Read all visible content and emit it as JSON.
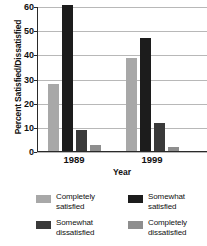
{
  "chart_data": {
    "type": "bar",
    "title": "",
    "xlabel": "Year",
    "ylabel": "Percent Satisfied/Dissatisfied",
    "categories": [
      "1989",
      "1999"
    ],
    "ylim": [
      0,
      60
    ],
    "yticks": [
      0,
      10,
      20,
      30,
      40,
      50,
      60
    ],
    "grid": true,
    "legend_position": "bottom",
    "series": [
      {
        "name": "Completely satisfied",
        "color": "#a8a8a8",
        "values": [
          28,
          39
        ]
      },
      {
        "name": "Somewhat satisfied",
        "color": "#1c1c1c",
        "values": [
          61,
          47
        ]
      },
      {
        "name": "Somewhat dissatisfied",
        "color": "#3a3a3a",
        "values": [
          9,
          12
        ]
      },
      {
        "name": "Completely dissatisfied",
        "color": "#8e8e8e",
        "values": [
          3,
          2
        ]
      }
    ]
  },
  "axes": {
    "ylabel": "Percent Satisfied/Dissatisfied",
    "xlabel": "Year",
    "ytick_labels": [
      "60",
      "50",
      "40",
      "30",
      "20",
      "10",
      "0"
    ],
    "xtick_labels": [
      "1989",
      "1999"
    ]
  },
  "legend": {
    "items": [
      {
        "line1": "Completely",
        "line2": "satisfied",
        "color": "#a8a8a8"
      },
      {
        "line1": "Somewhat",
        "line2": "satisfied",
        "color": "#1c1c1c"
      },
      {
        "line1": "Somewhat",
        "line2": "dissatisfied",
        "color": "#3a3a3a"
      },
      {
        "line1": "Completely",
        "line2": "dissatisfied",
        "color": "#8e8e8e"
      }
    ]
  },
  "title": {
    "text": ""
  }
}
